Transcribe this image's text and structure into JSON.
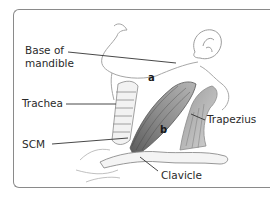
{
  "figure": {
    "labels": {
      "base_of_mandible_line1": "Base of",
      "base_of_mandible_line2": "mandible",
      "trachea": "Trachea",
      "scm": "SCM",
      "trapezius": "Trapezius",
      "clavicle": "Clavicle"
    },
    "region_markers": {
      "a": "a",
      "b": "b"
    },
    "colors": {
      "frame": "#8a8a8a",
      "leader_line": "#333333",
      "label_text": "#2a2a2a",
      "muscle_shading": "#6f6f6f",
      "outline": "#9a9a9a"
    }
  }
}
